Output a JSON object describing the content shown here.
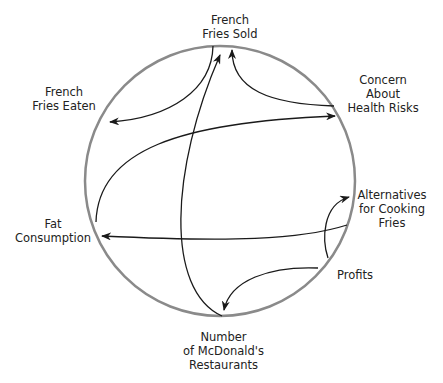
{
  "diagram": {
    "type": "causal-loop circle diagram",
    "circle": {
      "cx": 220,
      "cy": 181,
      "r": 134,
      "stroke": "#8a8a8a"
    },
    "nodes": [
      {
        "id": "fries_sold",
        "lines": [
          "French",
          "Fries Sold"
        ]
      },
      {
        "id": "fries_eaten",
        "lines": [
          "French",
          "Fries Eaten"
        ]
      },
      {
        "id": "health_concern",
        "lines": [
          "Concern",
          "About",
          "Health Risks"
        ]
      },
      {
        "id": "alternatives",
        "lines": [
          "Alternatives",
          "for Cooking",
          "Fries"
        ]
      },
      {
        "id": "fat",
        "lines": [
          "Fat",
          "Consumption"
        ]
      },
      {
        "id": "profits",
        "lines": [
          "Profits"
        ]
      },
      {
        "id": "restaurants",
        "lines": [
          "Number",
          "of McDonald's",
          "Restaurants"
        ]
      }
    ],
    "links": [
      {
        "from": "fries_sold",
        "to": "fries_eaten"
      },
      {
        "from": "restaurants",
        "to": "fries_sold"
      },
      {
        "from": "health_concern",
        "to": "fries_sold"
      },
      {
        "from": "fat",
        "to": "health_concern"
      },
      {
        "from": "alternatives",
        "to": "fat"
      },
      {
        "from": "profits",
        "to": "alternatives"
      },
      {
        "from": "profits",
        "to": "restaurants"
      }
    ],
    "line_color": "#1a1a1a"
  }
}
